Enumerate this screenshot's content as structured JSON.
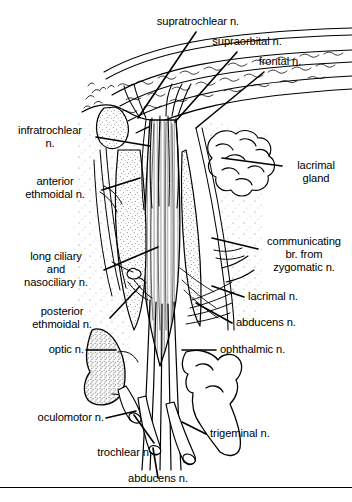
{
  "figure": {
    "background_color": "#ffffff",
    "ink_color": "#000000",
    "width": 352,
    "height": 502
  },
  "labels": [
    {
      "id": "supratrochlear",
      "text": "supratrochlear n.",
      "align": "center"
    },
    {
      "id": "supraorbital",
      "text": "supraorbital n.",
      "align": "center"
    },
    {
      "id": "frontal",
      "text": "frontal n.",
      "align": "center"
    },
    {
      "id": "infratrochlear",
      "text": "infratrochlear\nn.",
      "align": "center"
    },
    {
      "id": "anterior_ethmoidal",
      "text": "anterior\nethmoidal n.",
      "align": "center"
    },
    {
      "id": "long_ciliary",
      "text": "long ciliary\nand\nnasociliary n.",
      "align": "center"
    },
    {
      "id": "posterior_ethmoidal",
      "text": "posterior\nethmoidal n.",
      "align": "center"
    },
    {
      "id": "optic",
      "text": "optic n.",
      "align": "right"
    },
    {
      "id": "oculomotor",
      "text": "oculomotor n.",
      "align": "right"
    },
    {
      "id": "trochlear",
      "text": "trochlear n.",
      "align": "right"
    },
    {
      "id": "abducens_bottom",
      "text": "abducens n.",
      "align": "center"
    },
    {
      "id": "lacrimal_gland",
      "text": "lacrimal\ngland",
      "align": "center"
    },
    {
      "id": "communicating",
      "text": "communicating\nbr. from\nzygomatic n.",
      "align": "center"
    },
    {
      "id": "lacrimal",
      "text": "lacrimal n.",
      "align": "left"
    },
    {
      "id": "abducens_right",
      "text": "abducens n.",
      "align": "left"
    },
    {
      "id": "ophthalmic",
      "text": "ophthalmic n.",
      "align": "left"
    },
    {
      "id": "trigeminal",
      "text": "trigeminal n.",
      "align": "left"
    }
  ]
}
